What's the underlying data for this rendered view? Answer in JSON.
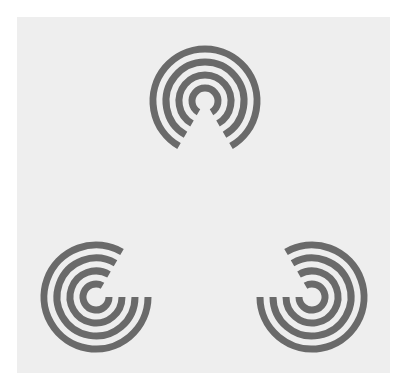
{
  "figure": {
    "title": "Kanizsa illusory triangle formed by concentric-ring inducers",
    "colors": {
      "background_outer": "#ffffff",
      "background_panel": "#eeeeee",
      "ring": "#6b6b6b"
    },
    "inducers": [
      {
        "name": "top",
        "ring_count": 4,
        "gap_facing": "down"
      },
      {
        "name": "bottom-left",
        "ring_count": 4,
        "gap_facing": "up-right"
      },
      {
        "name": "bottom-right",
        "ring_count": 4,
        "gap_facing": "up-left"
      }
    ],
    "illusory_shape": "triangle",
    "gap_angle_degrees": 60
  }
}
